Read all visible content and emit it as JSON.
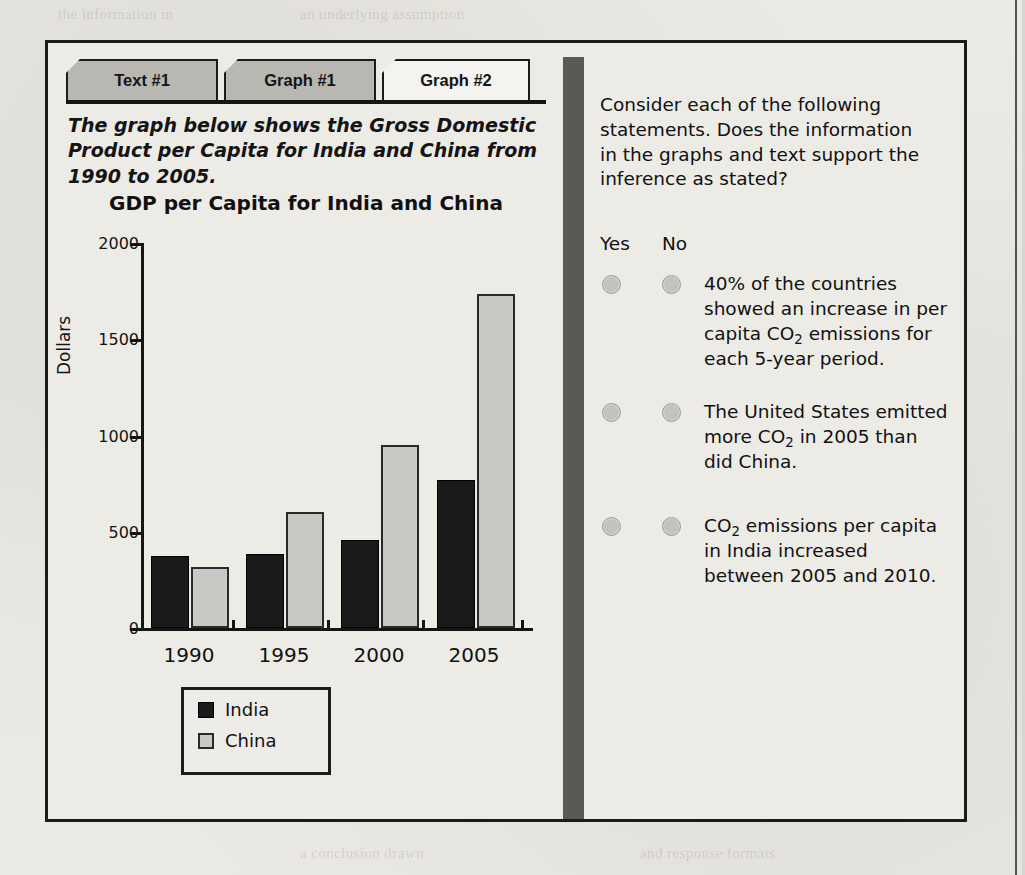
{
  "tabs": [
    {
      "label": "Text #1",
      "state": "inactive"
    },
    {
      "label": "Graph #1",
      "state": "inactive"
    },
    {
      "label": "Graph #2",
      "state": "active"
    }
  ],
  "prompt": "The graph below shows the Gross Domestic Product per Capita for India and China from 1990 to 2005.",
  "chart_data": {
    "type": "bar",
    "title": "GDP per Capita for India and China",
    "xlabel": "",
    "ylabel": "Dollars",
    "categories": [
      "1990",
      "1995",
      "2000",
      "2005"
    ],
    "series": [
      {
        "name": "India",
        "values": [
          375,
          385,
          455,
          770
        ],
        "color": "#1a1a1a"
      },
      {
        "name": "China",
        "values": [
          315,
          605,
          950,
          1735
        ],
        "color": "#c9c8c4"
      }
    ],
    "ylim": [
      0,
      2000
    ],
    "yticks": [
      0,
      500,
      1000,
      1500,
      2000
    ],
    "ytick_labels": [
      "0",
      "500",
      "1000",
      "1500",
      "2000"
    ],
    "grid": false,
    "legend": {
      "position": "bottom-left",
      "entries": [
        "India",
        "China"
      ]
    }
  },
  "question_panel": {
    "intro": "Consider each of the following statements. Does the information in the graphs and text support the inference as stated?",
    "column_headers": {
      "yes": "Yes",
      "no": "No"
    },
    "items": [
      {
        "text_parts": [
          "40% of the countries showed an increase in per capita CO",
          "2",
          " emissions for each 5-year period."
        ],
        "selected": "none"
      },
      {
        "text_parts": [
          "The United States emitted more CO",
          "2",
          " in 2005 than did China."
        ],
        "selected": "none"
      },
      {
        "text_parts": [
          "CO",
          "2",
          " emissions per capita in India increased between 2005 and 2010."
        ],
        "selected": "none"
      }
    ]
  },
  "colors": {
    "page": "#e9e7e2",
    "border": "#1b1b1b",
    "tab_inactive": "#b9b7b2",
    "tab_active": "#f4f3f0",
    "divider": "#595957",
    "radio": "#c3c2bd"
  },
  "ghost_text": {
    "l1": "the information in",
    "l2": "an underlying assumption",
    "l3": "a conclusion drawn",
    "l4": "and response formats"
  }
}
